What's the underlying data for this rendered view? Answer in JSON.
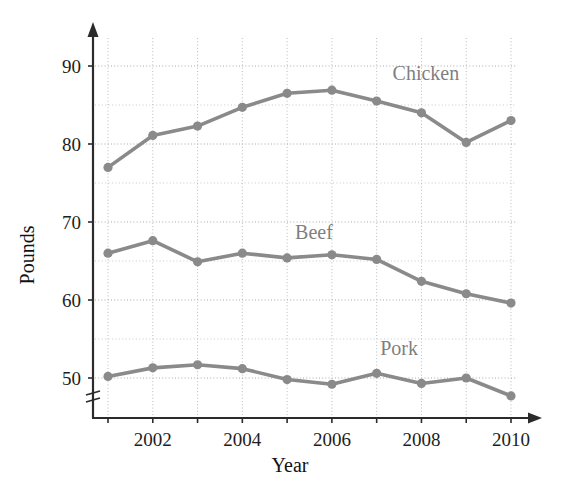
{
  "chart_data": {
    "type": "line",
    "title": "",
    "xlabel": "Year",
    "ylabel": "Pounds",
    "x": [
      2001,
      2002,
      2003,
      2004,
      2005,
      2006,
      2007,
      2008,
      2009,
      2010
    ],
    "xtick_labels": [
      "",
      "2002",
      "",
      "2004",
      "",
      "2006",
      "",
      "2008",
      "",
      "2010"
    ],
    "ytick_labels": [
      "50",
      "60",
      "70",
      "80",
      "90"
    ],
    "yticks": [
      50,
      60,
      70,
      80,
      90
    ],
    "yticks_minor": [
      55,
      65,
      75,
      85
    ],
    "ylim": [
      46,
      91
    ],
    "xlim": [
      2000.6,
      2010.6
    ],
    "grid": true,
    "axis_break": true,
    "legend": "inline-labels",
    "series": [
      {
        "name": "Chicken",
        "color": "#8a8a8a",
        "label_x": 2008.1,
        "label_y": 88.2,
        "values": [
          77.0,
          81.1,
          82.3,
          84.7,
          86.5,
          86.9,
          85.5,
          84.0,
          80.2,
          83.0
        ]
      },
      {
        "name": "Beef",
        "color": "#8a8a8a",
        "label_x": 2005.6,
        "label_y": 67.8,
        "values": [
          66.0,
          67.6,
          64.9,
          66.0,
          65.4,
          65.8,
          65.2,
          62.4,
          60.8,
          59.6
        ]
      },
      {
        "name": "Pork",
        "color": "#8a8a8a",
        "label_x": 2007.5,
        "label_y": 52.9,
        "values": [
          50.2,
          51.3,
          51.7,
          51.2,
          49.8,
          49.2,
          50.6,
          49.3,
          50.0,
          47.7
        ]
      }
    ]
  },
  "labels": {
    "x_axis_title": "Year",
    "y_axis_title": "Pounds"
  }
}
